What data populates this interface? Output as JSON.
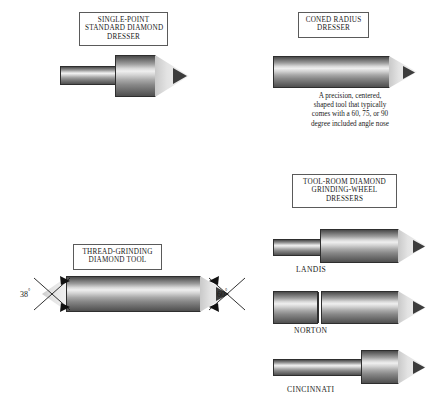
{
  "page": {
    "background": "#ffffff"
  },
  "figures": [
    {
      "id": "single-point-standard-diamond-dresser",
      "caption_lines": [
        "SINGLE-POINT",
        "STANDARD DIAMOND",
        "DRESSER"
      ],
      "shape": "stepped shank with enlarged head and conical diamond point"
    },
    {
      "id": "coned-radius-dresser",
      "caption_lines": [
        "CONED RADIUS",
        "DRESSER"
      ],
      "shape": "plain cylinder with conical diamond point",
      "description_lines": [
        "A precision, centered,",
        "shaped tool that typically",
        "comes with a 60, 75, or 90",
        "degree included angle nose"
      ]
    },
    {
      "id": "thread-grinding-diamond-tool",
      "caption_lines": [
        "THREAD-GRINDING",
        "DIAMOND TOOL"
      ],
      "shape": "cylinder with conical points on both ends",
      "angles": [
        {
          "name": "left-angle",
          "value": "38",
          "unit": "°",
          "position": "left"
        },
        {
          "name": "right-angle",
          "value": "60",
          "unit": "°",
          "position": "right"
        }
      ]
    },
    {
      "id": "tool-room-diamond-grinding-wheel-dressers",
      "caption_lines": [
        "TOOL-ROOM  DIAMOND",
        "GRINDING-WHEEL",
        "DRESSERS"
      ],
      "variants": [
        {
          "name": "landis",
          "label": "LANDIS",
          "shape": "small shank stepping up to large body with conical point"
        },
        {
          "name": "norton",
          "label": "NORTON",
          "shape": "uniform cylinder with seam groove and conical point"
        },
        {
          "name": "cincinnati",
          "label": "CINCINNATI",
          "shape": "slim shank with short enlarged head and conical point"
        }
      ]
    }
  ],
  "colors": {
    "outline": "#2e2e2e",
    "box_border": "#5a5a5a",
    "cylinder_highlight": "#efefef",
    "cylinder_shadow": "#4a4a4a",
    "cone_face": "#e3e3e3",
    "diamond_tip": "#3c3c3c",
    "text": "#1a1a1a"
  }
}
